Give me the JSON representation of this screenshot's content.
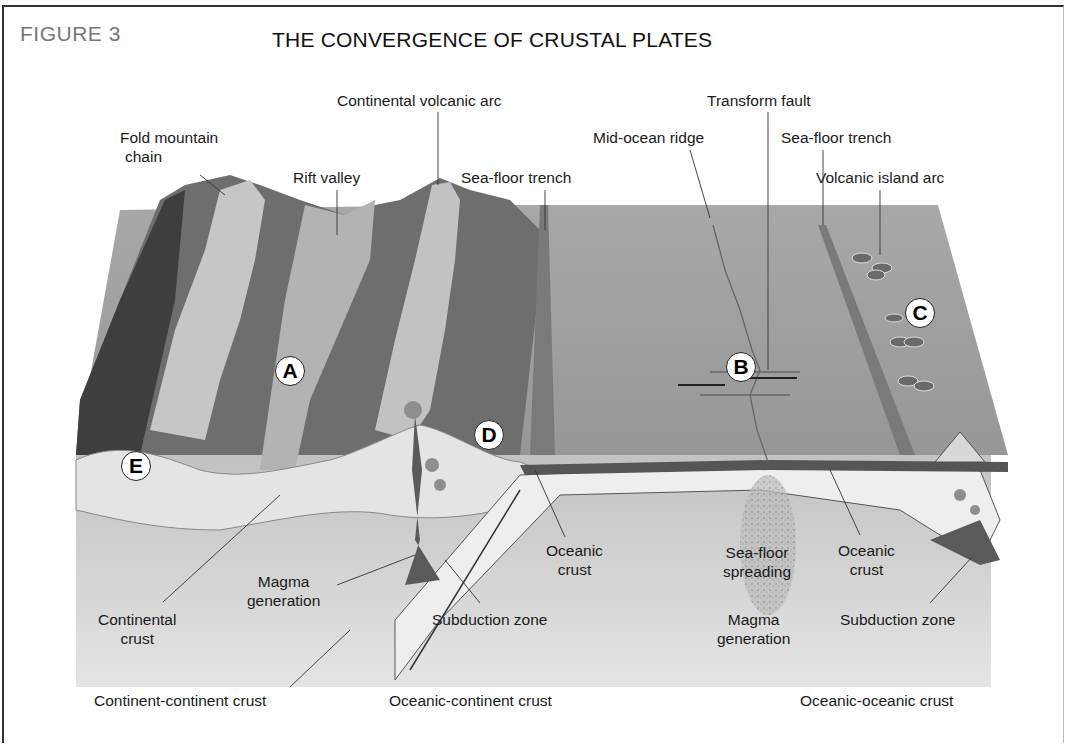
{
  "figure": {
    "label": "FIGURE 3",
    "title": "THE CONVERGENCE OF CRUSTAL PLATES"
  },
  "surface_labels": {
    "fold_mountain_chain": [
      "Fold mountain",
      "chain"
    ],
    "rift_valley": "Rift valley",
    "continental_volcanic_arc": "Continental volcanic arc",
    "sea_floor_trench_left": "Sea-floor trench",
    "mid_ocean_ridge": "Mid-ocean ridge",
    "transform_fault": "Transform fault",
    "sea_floor_trench_right": "Sea-floor trench",
    "volcanic_island_arc": "Volcanic island arc"
  },
  "cross_section_labels": {
    "continental_crust": [
      "Continental",
      "crust"
    ],
    "magma_generation_left": [
      "Magma",
      "generation"
    ],
    "subduction_zone_left": "Subduction zone",
    "oceanic_crust_left": [
      "Oceanic",
      "crust"
    ],
    "sea_floor_spreading": [
      "Sea-floor",
      "spreading"
    ],
    "magma_generation_center": [
      "Magma",
      "generation"
    ],
    "oceanic_crust_right": [
      "Oceanic",
      "crust"
    ],
    "subduction_zone_right": "Subduction zone"
  },
  "markers": [
    "A",
    "B",
    "C",
    "D",
    "E"
  ],
  "boundary_types": {
    "left": "Continent-continent crust",
    "center": "Oceanic-continent crust",
    "right": "Oceanic-oceanic crust"
  },
  "colors": {
    "frame": "#333333",
    "figure_label": "#777777",
    "ocean_surface": "#9a9a9a",
    "mountain_dark": "#5a5a5a",
    "mountain_light": "#c4c4c4",
    "crust_light": "#e6e6e6",
    "mantle": "#cfcfcf",
    "magma": "#4a4a4a"
  }
}
